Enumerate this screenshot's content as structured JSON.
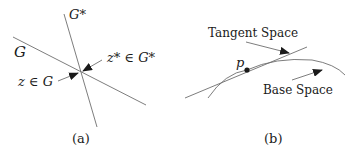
{
  "panel_a": {
    "caption": "(a)",
    "line_g_label": "G",
    "line_gstar_label": "G*",
    "point_zstar_label": "z* ∈ G*",
    "point_z_label": "z ∈ G"
  },
  "panel_b": {
    "caption": "(b)",
    "point_label": "p",
    "tangent_label": "Tangent Space",
    "base_label": "Base Space"
  },
  "colors": {
    "line": "#6e6e6e",
    "ink": "#1a1a1a",
    "background": "#ffffff"
  }
}
